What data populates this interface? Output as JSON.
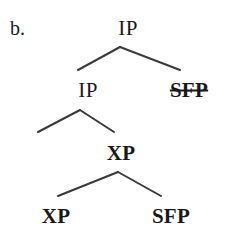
{
  "figure": {
    "label": "b.",
    "caption": "",
    "background_color": "#ffffff",
    "ink_color": "#19191c",
    "width": 228,
    "height": 236
  },
  "tree": {
    "description": "syntactic tree diagram with four levels showing IP, SFP and XP nodes",
    "nodes": [
      {
        "id": "root-ip",
        "label": "IP",
        "level": 1,
        "x": 128,
        "y": 28,
        "bold": false,
        "strikethrough": false
      },
      {
        "id": "ip-2",
        "label": "IP",
        "level": 2,
        "x": 88,
        "y": 90,
        "bold": false,
        "strikethrough": false
      },
      {
        "id": "sfp-struck",
        "label": "SFP",
        "level": 2,
        "x": 189,
        "y": 90,
        "bold": true,
        "strikethrough": true
      },
      {
        "id": "xp-3",
        "label": "XP",
        "level": 3,
        "x": 121,
        "y": 153,
        "bold": true,
        "strikethrough": false
      },
      {
        "id": "xp-leaf",
        "label": "XP",
        "level": 4,
        "x": 56,
        "y": 216,
        "bold": true,
        "strikethrough": false
      },
      {
        "id": "sfp-leaf",
        "label": "SFP",
        "level": 4,
        "x": 171,
        "y": 216,
        "bold": true,
        "strikethrough": false
      }
    ],
    "branches": [
      {
        "id": "branch-root",
        "apex_x": 120,
        "apex_y": 47,
        "left_x": 78,
        "left_y": 70,
        "right_x": 180,
        "right_y": 70
      },
      {
        "id": "branch-ip2",
        "apex_x": 80,
        "apex_y": 110,
        "left_x": 38,
        "left_y": 132,
        "right_x": 114,
        "right_y": 132
      },
      {
        "id": "branch-xp3",
        "apex_x": 118,
        "apex_y": 172,
        "left_x": 58,
        "left_y": 196,
        "right_x": 161,
        "right_y": 196
      }
    ],
    "line_color": "#3a3a3e",
    "line_width": 2
  }
}
